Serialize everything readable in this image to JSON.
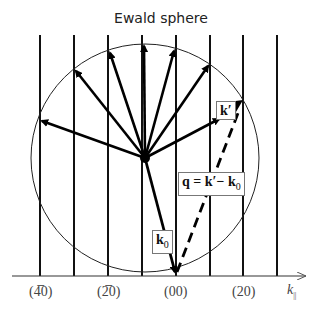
{
  "title": "Ewald sphere",
  "diagram": {
    "type": "ewald-sphere",
    "vertical_lines_x": [
      40,
      74,
      108,
      142,
      176,
      210,
      243,
      277
    ],
    "circle": {
      "cx": 145,
      "cy": 158,
      "r": 114
    },
    "axis": {
      "y": 276,
      "label": "k",
      "label_sub": "||"
    },
    "tick_labels": [
      "(4̅0)",
      "(2̅0)",
      "(00)",
      "(20)"
    ],
    "labels": {
      "k_prime": "k′",
      "k0_main": "k",
      "k0_sub": "0",
      "q_eq_main": "q = k′− k",
      "q_eq_sub": "0"
    }
  }
}
